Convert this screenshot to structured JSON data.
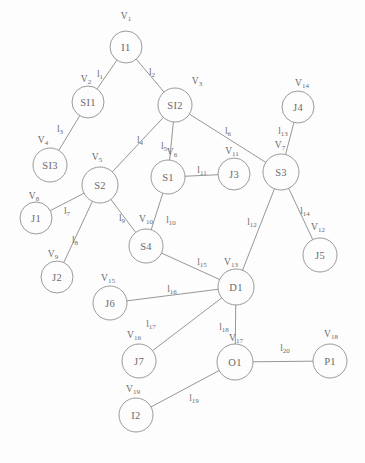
{
  "diagram": {
    "stroke_color": "#8a8a8a",
    "text_color": "#6a6a6a",
    "background": "#fdfdfd",
    "nodes": [
      {
        "id": "I1",
        "label": "I1",
        "vertex": "V1",
        "x": 126,
        "y": 47,
        "r": 16,
        "vx": 126,
        "vy": 16
      },
      {
        "id": "SI1",
        "label": "SI1",
        "vertex": "V2",
        "x": 88,
        "y": 102,
        "r": 16,
        "vx": 86,
        "vy": 79
      },
      {
        "id": "SI2",
        "label": "SI2",
        "vertex": "V3",
        "x": 175,
        "y": 105,
        "r": 17,
        "vx": 197,
        "vy": 81
      },
      {
        "id": "SI3",
        "label": "SI3",
        "vertex": "V4",
        "x": 50,
        "y": 165,
        "r": 17,
        "vx": 43,
        "vy": 140
      },
      {
        "id": "S2",
        "label": "S2",
        "vertex": "V5",
        "x": 100,
        "y": 185,
        "r": 18,
        "vx": 97,
        "vy": 157
      },
      {
        "id": "S1",
        "label": "S1",
        "vertex": "V6",
        "x": 168,
        "y": 177,
        "r": 17,
        "vx": 172,
        "vy": 152
      },
      {
        "id": "J3",
        "label": "J3",
        "vertex": "V11",
        "x": 234,
        "y": 174,
        "r": 16,
        "vx": 232,
        "vy": 151
      },
      {
        "id": "S3",
        "label": "S3",
        "vertex": "V7",
        "x": 281,
        "y": 172,
        "r": 18,
        "vx": 280,
        "vy": 145
      },
      {
        "id": "J4",
        "label": "J4",
        "vertex": "V14",
        "x": 298,
        "y": 107,
        "r": 16,
        "vx": 302,
        "vy": 83
      },
      {
        "id": "J1",
        "label": "J1",
        "vertex": "V8",
        "x": 36,
        "y": 218,
        "r": 16,
        "vx": 34,
        "vy": 196
      },
      {
        "id": "S4",
        "label": "S4",
        "vertex": "V10",
        "x": 146,
        "y": 246,
        "r": 17,
        "vx": 146,
        "vy": 219
      },
      {
        "id": "J2",
        "label": "J2",
        "vertex": "V9",
        "x": 57,
        "y": 277,
        "r": 16,
        "vx": 53,
        "vy": 254
      },
      {
        "id": "J5",
        "label": "J5",
        "vertex": "V12",
        "x": 320,
        "y": 255,
        "r": 17,
        "vx": 318,
        "vy": 227
      },
      {
        "id": "J6",
        "label": "J6",
        "vertex": "V15",
        "x": 110,
        "y": 303,
        "r": 17,
        "vx": 108,
        "vy": 278
      },
      {
        "id": "D1",
        "label": "D1",
        "vertex": "V13",
        "x": 236,
        "y": 287,
        "r": 18,
        "vx": 231,
        "vy": 262
      },
      {
        "id": "J7",
        "label": "J7",
        "vertex": "V16",
        "x": 139,
        "y": 361,
        "r": 17,
        "vx": 134,
        "vy": 335
      },
      {
        "id": "O1",
        "label": "O1",
        "vertex": "V17",
        "x": 235,
        "y": 362,
        "r": 18,
        "vx": 236,
        "vy": 338
      },
      {
        "id": "P1",
        "label": "P1",
        "vertex": "V18",
        "x": 330,
        "y": 361,
        "r": 17,
        "vx": 331,
        "vy": 334
      },
      {
        "id": "I2",
        "label": "I2",
        "vertex": "V19",
        "x": 136,
        "y": 415,
        "r": 17,
        "vx": 133,
        "vy": 389
      }
    ],
    "edges": [
      {
        "id": "l1",
        "label": "l1",
        "from": "I1",
        "to": "SI1",
        "lx": 100,
        "ly": 74
      },
      {
        "id": "l2",
        "label": "l2",
        "from": "I1",
        "to": "SI2",
        "lx": 152,
        "ly": 72
      },
      {
        "id": "l3",
        "label": "l3",
        "from": "SI1",
        "to": "SI3",
        "lx": 60,
        "ly": 129
      },
      {
        "id": "l4",
        "label": "l4",
        "from": "SI2",
        "to": "S2",
        "lx": 140,
        "ly": 140
      },
      {
        "id": "l5",
        "label": "l5",
        "from": "SI2",
        "to": "S1",
        "lx": 164,
        "ly": 146
      },
      {
        "id": "l6",
        "label": "l6",
        "from": "SI2",
        "to": "S3",
        "lx": 228,
        "ly": 131
      },
      {
        "id": "l7",
        "label": "l7",
        "from": "J1",
        "to": "S2",
        "lx": 67,
        "ly": 211
      },
      {
        "id": "l8",
        "label": "l8",
        "from": "J2",
        "to": "S2",
        "lx": 75,
        "ly": 240
      },
      {
        "id": "l9",
        "label": "l9",
        "from": "S2",
        "to": "S4",
        "lx": 122,
        "ly": 218
      },
      {
        "id": "l10",
        "label": "l10",
        "from": "S1",
        "to": "S4",
        "lx": 171,
        "ly": 220
      },
      {
        "id": "l11",
        "label": "l11",
        "from": "S1",
        "to": "J3",
        "lx": 202,
        "ly": 170
      },
      {
        "id": "l12",
        "label": "l12",
        "from": "S3",
        "to": "D1",
        "lx": 252,
        "ly": 222
      },
      {
        "id": "l13",
        "label": "l13",
        "from": "J4",
        "to": "S3",
        "lx": 283,
        "ly": 131
      },
      {
        "id": "l14",
        "label": "l14",
        "from": "S3",
        "to": "J5",
        "lx": 305,
        "ly": 211
      },
      {
        "id": "l15",
        "label": "l15",
        "from": "S4",
        "to": "D1",
        "lx": 202,
        "ly": 262
      },
      {
        "id": "l16",
        "label": "l16",
        "from": "J6",
        "to": "D1",
        "lx": 172,
        "ly": 289
      },
      {
        "id": "l17",
        "label": "l17",
        "from": "J7",
        "to": "D1",
        "lx": 151,
        "ly": 324
      },
      {
        "id": "l18",
        "label": "l18",
        "from": "D1",
        "to": "O1",
        "lx": 224,
        "ly": 327
      },
      {
        "id": "l19",
        "label": "l19",
        "from": "I2",
        "to": "O1",
        "lx": 194,
        "ly": 398
      },
      {
        "id": "l20",
        "label": "l20",
        "from": "O1",
        "to": "P1",
        "lx": 285,
        "ly": 348
      }
    ]
  }
}
